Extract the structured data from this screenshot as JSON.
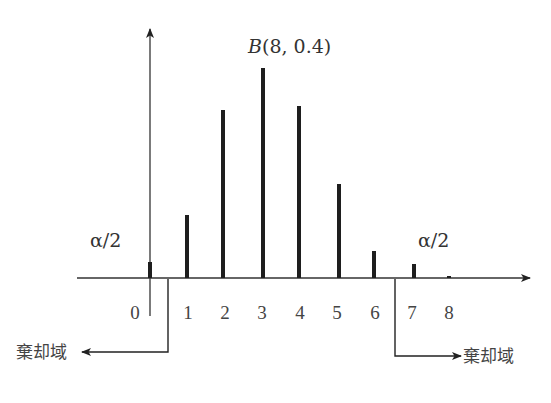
{
  "chart_data": {
    "type": "bar",
    "title": "B(8, 0.4)",
    "xlabel": "",
    "ylabel": "",
    "categories": [
      "0",
      "1",
      "2",
      "3",
      "4",
      "5",
      "6",
      "7",
      "8"
    ],
    "values": [
      0.0168,
      0.0896,
      0.209,
      0.2787,
      0.2322,
      0.1239,
      0.0413,
      0.0079,
      0.0007
    ],
    "drawn_heights_px": [
      16,
      63,
      168,
      210,
      172,
      94,
      27,
      14,
      2
    ],
    "grid": false,
    "legend": null,
    "annotations": [
      {
        "text": "α/2",
        "position": "left tail"
      },
      {
        "text": "α/2",
        "position": "right tail"
      },
      {
        "text": "棄却域",
        "position": "left rejection region, arrow pointing left"
      },
      {
        "text": "棄却域",
        "position": "right rejection region, arrow pointing right"
      }
    ],
    "rejection_region": {
      "left_boundary_between": [
        "0",
        "1"
      ],
      "right_boundary_between": [
        "6",
        "7"
      ]
    }
  },
  "figure": {
    "distribution_label_prefix": "B",
    "distribution_label_args": "(8, 0.4)",
    "left_alpha_label": "α/2",
    "right_alpha_label": "α/2",
    "left_rejection_label": "棄却域",
    "right_rejection_label": "棄却域",
    "tick_labels": [
      "0",
      "1",
      "2",
      "3",
      "4",
      "5",
      "6",
      "7",
      "8"
    ],
    "bar_x_px": [
      150,
      187,
      223,
      263,
      299,
      339,
      374,
      414,
      449
    ],
    "label_x_px": [
      135,
      188,
      225,
      262,
      300,
      337,
      375,
      412,
      449
    ],
    "axis_y_px": 278,
    "bar_color": "#1e1e1e",
    "axis_color": "#333333"
  }
}
